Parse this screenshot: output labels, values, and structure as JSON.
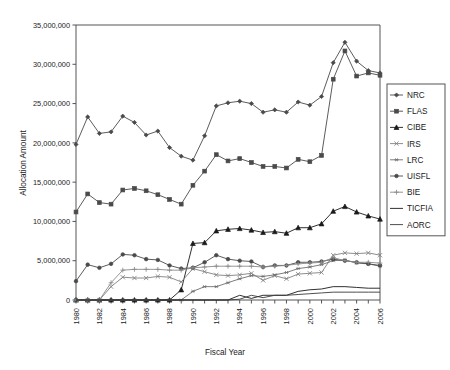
{
  "chart_data": {
    "type": "line",
    "title": "",
    "xlabel": "Fiscal Year",
    "ylabel": "Allocation Amount",
    "xlim": [
      1980,
      2006
    ],
    "ylim": [
      0,
      35000000
    ],
    "grid": false,
    "legend_position": "right",
    "x": [
      1980,
      1981,
      1982,
      1983,
      1984,
      1985,
      1986,
      1987,
      1988,
      1989,
      1990,
      1991,
      1992,
      1993,
      1994,
      1995,
      1996,
      1997,
      1998,
      1999,
      2000,
      2001,
      2002,
      2003,
      2004,
      2005,
      2006
    ],
    "x_tick_labels": [
      "1980",
      "1982",
      "1984",
      "1986",
      "1988",
      "1990",
      "1992",
      "1994",
      "1996",
      "1998",
      "2000",
      "2002",
      "2004",
      "2006"
    ],
    "y_tick_labels": [
      "0",
      "5,000,000",
      "10,000,000",
      "15,000,000",
      "20,000,000",
      "25,000,000",
      "30,000,000",
      "35,000,000"
    ],
    "y_ticks": [
      0,
      5000000,
      10000000,
      15000000,
      20000000,
      25000000,
      30000000,
      35000000
    ],
    "series": [
      {
        "name": "NRC",
        "marker": "diamond",
        "color": "#4a4a4a",
        "values": [
          19800000,
          23300000,
          21200000,
          21400000,
          23400000,
          22600000,
          21000000,
          21500000,
          19400000,
          18300000,
          17800000,
          20900000,
          24700000,
          25100000,
          25300000,
          25000000,
          23900000,
          24200000,
          23900000,
          25200000,
          24800000,
          25900000,
          30200000,
          32800000,
          30400000,
          29200000,
          28900000
        ]
      },
      {
        "name": "FLAS",
        "marker": "square",
        "color": "#4a4a4a",
        "values": [
          11200000,
          13500000,
          12400000,
          12200000,
          14000000,
          14200000,
          13900000,
          13400000,
          12800000,
          12200000,
          14600000,
          16400000,
          18500000,
          17700000,
          18000000,
          17500000,
          17000000,
          17000000,
          16800000,
          17900000,
          17600000,
          18400000,
          28100000,
          31700000,
          28500000,
          28900000,
          28600000
        ]
      },
      {
        "name": "CIBE",
        "marker": "triangle",
        "color": "#1a1a1a",
        "values": [
          0,
          0,
          0,
          0,
          0,
          0,
          0,
          0,
          0,
          1300000,
          7200000,
          7300000,
          8800000,
          9000000,
          9100000,
          8900000,
          8600000,
          8700000,
          8500000,
          9200000,
          9200000,
          9700000,
          11300000,
          11900000,
          11200000,
          10700000,
          10300000
        ]
      },
      {
        "name": "IRS",
        "marker": "x",
        "color": "#808080",
        "values": [
          0,
          0,
          0,
          1700000,
          2900000,
          2800000,
          2800000,
          3000000,
          2900000,
          2300000,
          4000000,
          3600000,
          3200000,
          3100000,
          3200000,
          3400000,
          2500000,
          3100000,
          2700000,
          3300000,
          3400000,
          3500000,
          5700000,
          6000000,
          5900000,
          6000000,
          5700000
        ]
      },
      {
        "name": "LRC",
        "marker": "star",
        "color": "#6e6e6e",
        "values": [
          0,
          0,
          0,
          0,
          0,
          0,
          0,
          0,
          0,
          0,
          1100000,
          1700000,
          1700000,
          2200000,
          2700000,
          3100000,
          3000000,
          3200000,
          3500000,
          4000000,
          4200000,
          4500000,
          5000000,
          5100000,
          4700000,
          4600000,
          4300000
        ]
      },
      {
        "name": "UISFL",
        "marker": "circle",
        "color": "#4a4a4a",
        "values": [
          2400000,
          4500000,
          4100000,
          4600000,
          5800000,
          5700000,
          5200000,
          5100000,
          4400000,
          4000000,
          4100000,
          4800000,
          5700000,
          5200000,
          5000000,
          4900000,
          4200000,
          4400000,
          4400000,
          4800000,
          4800000,
          4900000,
          5200000,
          5000000,
          4800000,
          4600000,
          4400000
        ]
      },
      {
        "name": "BIE",
        "marker": "plus",
        "color": "#8a8a8a",
        "values": [
          0,
          0,
          0,
          2200000,
          3800000,
          3900000,
          3900000,
          3900000,
          3800000,
          3800000,
          4100000,
          4200000,
          4300000,
          4300000,
          4300000,
          4300000,
          4200000,
          4300000,
          4400000,
          4600000,
          4700000,
          4800000,
          5400000,
          5000000,
          4800000,
          4800000,
          4700000
        ]
      },
      {
        "name": "TICFIA",
        "marker": "none",
        "color": "#1a1a1a",
        "values": [
          0,
          0,
          0,
          0,
          0,
          0,
          0,
          0,
          0,
          0,
          0,
          0,
          0,
          0,
          600000,
          200000,
          600000,
          600000,
          600000,
          1100000,
          1300000,
          1400000,
          1700000,
          1700000,
          1600000,
          1500000,
          1500000
        ]
      },
      {
        "name": "AORC",
        "marker": "none",
        "color": "#3a3a3a",
        "values": [
          0,
          0,
          0,
          0,
          0,
          0,
          0,
          0,
          0,
          0,
          0,
          0,
          0,
          0,
          100000,
          600000,
          300000,
          600000,
          600000,
          700000,
          800000,
          900000,
          1000000,
          1000000,
          1000000,
          1000000,
          1000000
        ]
      }
    ]
  },
  "legend": {
    "items": [
      "NRC",
      "FLAS",
      "CIBE",
      "IRS",
      "LRC",
      "UISFL",
      "BIE",
      "TICFIA",
      "AORC"
    ]
  }
}
